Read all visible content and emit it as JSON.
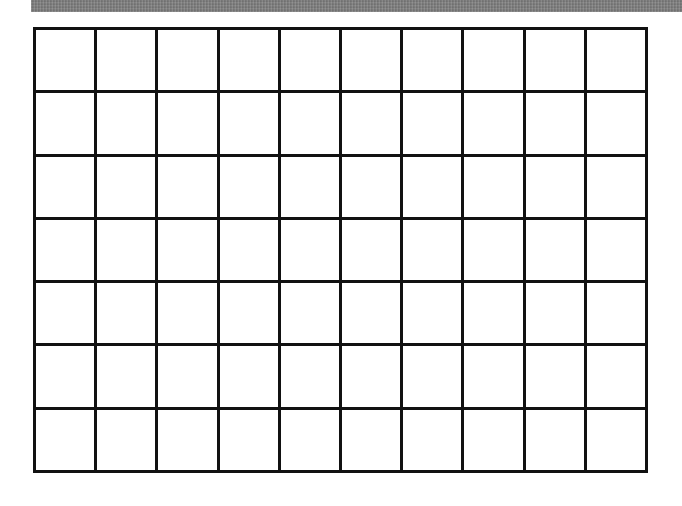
{
  "page": {
    "background_color": "#ffffff",
    "width": 682,
    "height": 506
  },
  "banner": {
    "name": "top-gray-bar",
    "color": "#7b7b7b",
    "label": ""
  },
  "grid": {
    "name": "empty-grid-table",
    "columns": 10,
    "rows": 7,
    "border_color": "#111111",
    "border_width_px": 3,
    "cell_fill": "#ffffff",
    "cells": [
      [
        "",
        "",
        "",
        "",
        "",
        "",
        "",
        "",
        "",
        ""
      ],
      [
        "",
        "",
        "",
        "",
        "",
        "",
        "",
        "",
        "",
        ""
      ],
      [
        "",
        "",
        "",
        "",
        "",
        "",
        "",
        "",
        "",
        ""
      ],
      [
        "",
        "",
        "",
        "",
        "",
        "",
        "",
        "",
        "",
        ""
      ],
      [
        "",
        "",
        "",
        "",
        "",
        "",
        "",
        "",
        "",
        ""
      ],
      [
        "",
        "",
        "",
        "",
        "",
        "",
        "",
        "",
        "",
        ""
      ],
      [
        "",
        "",
        "",
        "",
        "",
        "",
        "",
        "",
        "",
        ""
      ]
    ]
  }
}
